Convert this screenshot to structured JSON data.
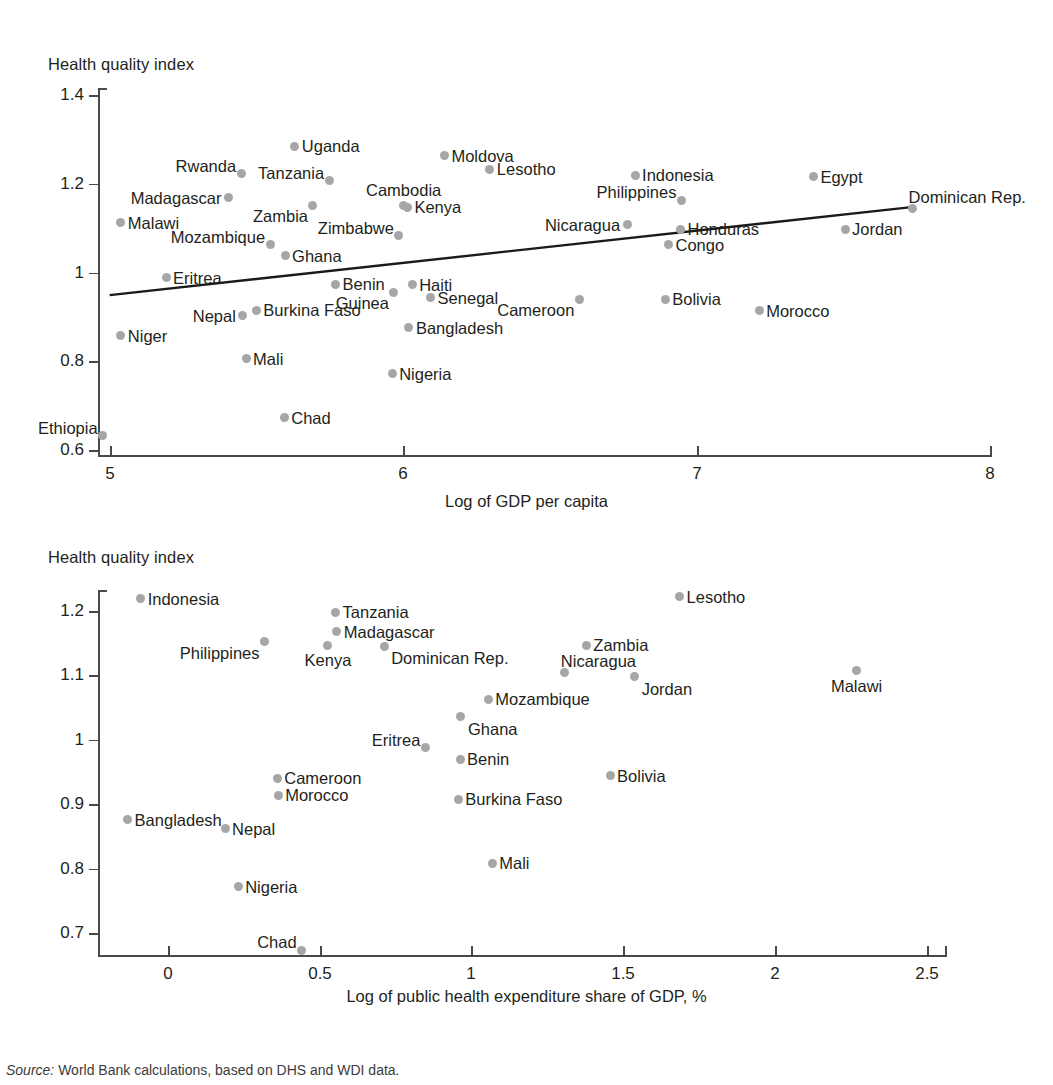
{
  "figure": {
    "source_prefix": "Source:",
    "source_text": " World Bank calculations, based on DHS and WDI data.",
    "marker_color": "#a6a6a6",
    "axis_color": "#4a4a4a",
    "text_color": "#231f20"
  },
  "chart_data": [
    {
      "type": "scatter",
      "title": "",
      "ylabel": "Health quality index",
      "xlabel": "Log of GDP per capita",
      "xlim": [
        4.94,
        8.0
      ],
      "ylim": [
        0.588,
        1.402
      ],
      "xticks": [
        5,
        6,
        7,
        8
      ],
      "xticklabels": [
        "5",
        "6",
        "7",
        "8"
      ],
      "yticks": [
        0.6,
        0.8,
        1.0,
        1.2,
        1.4
      ],
      "yticklabels": [
        "0.6",
        "0.8",
        "1",
        "1.2",
        "1.4"
      ],
      "grid": false,
      "legend": "none",
      "trendline": {
        "x0": 4.999,
        "y0": 0.949,
        "x1": 7.74,
        "y1": 1.148
      },
      "points": [
        {
          "name": "Ethiopia",
          "x": 4.975,
          "y": 0.632,
          "label_pos": "above-left"
        },
        {
          "name": "Niger",
          "x": 5.037,
          "y": 0.857,
          "label_pos": "right"
        },
        {
          "name": "Malawi",
          "x": 5.037,
          "y": 1.112,
          "label_pos": "right"
        },
        {
          "name": "Eritrea",
          "x": 5.191,
          "y": 0.988,
          "label_pos": "right"
        },
        {
          "name": "Madagascar",
          "x": 5.404,
          "y": 1.168,
          "label_pos": "left"
        },
        {
          "name": "Rwanda",
          "x": 5.447,
          "y": 1.222,
          "label_pos": "above-left"
        },
        {
          "name": "Nepal",
          "x": 5.453,
          "y": 0.903,
          "label_pos": "left"
        },
        {
          "name": "Mali",
          "x": 5.464,
          "y": 0.806,
          "label_pos": "right"
        },
        {
          "name": "Burkina Faso",
          "x": 5.499,
          "y": 0.915,
          "label_pos": "right"
        },
        {
          "name": "Mozambique",
          "x": 5.546,
          "y": 1.063,
          "label_pos": "above-left"
        },
        {
          "name": "Chad",
          "x": 5.594,
          "y": 0.673,
          "label_pos": "right"
        },
        {
          "name": "Ghana",
          "x": 5.597,
          "y": 1.038,
          "label_pos": "right"
        },
        {
          "name": "Uganda",
          "x": 5.63,
          "y": 1.285,
          "label_pos": "right"
        },
        {
          "name": "Zambia",
          "x": 5.692,
          "y": 1.152,
          "label_pos": "below-left"
        },
        {
          "name": "Tanzania",
          "x": 5.747,
          "y": 1.207,
          "label_pos": "above-left"
        },
        {
          "name": "Benin",
          "x": 5.769,
          "y": 0.974,
          "label_pos": "right"
        },
        {
          "name": "Nigeria",
          "x": 5.962,
          "y": 0.772,
          "label_pos": "right"
        },
        {
          "name": "Guinea",
          "x": 5.968,
          "y": 0.956,
          "label_pos": "below-left"
        },
        {
          "name": "Zimbabwe",
          "x": 5.985,
          "y": 1.083,
          "label_pos": "above-left"
        },
        {
          "name": "Cambodia",
          "x": 6.001,
          "y": 1.151,
          "label_pos": "above"
        },
        {
          "name": "Kenya",
          "x": 6.014,
          "y": 1.147,
          "label_pos": "right"
        },
        {
          "name": "Haiti",
          "x": 6.03,
          "y": 0.972,
          "label_pos": "right"
        },
        {
          "name": "Bangladesh",
          "x": 6.019,
          "y": 0.876,
          "label_pos": "right"
        },
        {
          "name": "Senegal",
          "x": 6.093,
          "y": 0.943,
          "label_pos": "right"
        },
        {
          "name": "Moldova",
          "x": 6.14,
          "y": 1.263,
          "label_pos": "right"
        },
        {
          "name": "Lesotho",
          "x": 6.295,
          "y": 1.233,
          "label_pos": "right"
        },
        {
          "name": "Cameroon",
          "x": 6.6,
          "y": 0.94,
          "label_pos": "below-left"
        },
        {
          "name": "Nicaragua",
          "x": 6.763,
          "y": 1.108,
          "label_pos": "left"
        },
        {
          "name": "Indonesia",
          "x": 6.79,
          "y": 1.219,
          "label_pos": "right"
        },
        {
          "name": "Bolivia",
          "x": 6.893,
          "y": 0.94,
          "label_pos": "right"
        },
        {
          "name": "Congo",
          "x": 6.904,
          "y": 1.063,
          "label_pos": "right"
        },
        {
          "name": "Philippines",
          "x": 6.948,
          "y": 1.163,
          "label_pos": "above-left"
        },
        {
          "name": "Honduras",
          "x": 6.945,
          "y": 1.097,
          "label_pos": "right"
        },
        {
          "name": "Morocco",
          "x": 7.213,
          "y": 0.914,
          "label_pos": "right"
        },
        {
          "name": "Egypt",
          "x": 7.398,
          "y": 1.216,
          "label_pos": "right"
        },
        {
          "name": "Jordan",
          "x": 7.506,
          "y": 1.097,
          "label_pos": "right"
        },
        {
          "name": "Dominican Rep.",
          "x": 7.736,
          "y": 1.145,
          "label_pos": "above-right"
        }
      ]
    },
    {
      "type": "scatter",
      "title": "",
      "ylabel": "Health quality index",
      "xlabel": "Log of public health expenditure share of GDP, %",
      "xlim": [
        -0.25,
        2.58
      ],
      "ylim": [
        0.655,
        1.245
      ],
      "xticks": [
        0,
        0.5,
        1,
        1.5,
        2,
        2.5
      ],
      "xticklabels": [
        "0",
        "0.5",
        "1",
        "1.5",
        "2",
        "2.5"
      ],
      "yticks": [
        0.7,
        0.8,
        0.9,
        1.0,
        1.1,
        1.2
      ],
      "yticklabels": [
        "0.7",
        "0.8",
        "0.9",
        "1",
        "1.1",
        "1.2"
      ],
      "grid": false,
      "legend": "none",
      "points": [
        {
          "name": "Bangladesh",
          "x": -0.133,
          "y": 0.876,
          "label_pos": "right"
        },
        {
          "name": "Indonesia",
          "x": -0.09,
          "y": 1.219,
          "label_pos": "right"
        },
        {
          "name": "Nepal",
          "x": 0.188,
          "y": 0.862,
          "label_pos": "right"
        },
        {
          "name": "Nigeria",
          "x": 0.231,
          "y": 0.772,
          "label_pos": "right"
        },
        {
          "name": "Philippines",
          "x": 0.318,
          "y": 1.152,
          "label_pos": "below-left"
        },
        {
          "name": "Cameroon",
          "x": 0.36,
          "y": 0.94,
          "label_pos": "right"
        },
        {
          "name": "Morocco",
          "x": 0.363,
          "y": 0.914,
          "label_pos": "right"
        },
        {
          "name": "Chad",
          "x": 0.44,
          "y": 0.673,
          "label_pos": "above-left"
        },
        {
          "name": "Kenya",
          "x": 0.527,
          "y": 1.147,
          "label_pos": "below"
        },
        {
          "name": "Tanzania",
          "x": 0.552,
          "y": 1.198,
          "label_pos": "right"
        },
        {
          "name": "Madagascar",
          "x": 0.556,
          "y": 1.168,
          "label_pos": "right"
        },
        {
          "name": "Dominican Rep.",
          "x": 0.712,
          "y": 1.145,
          "label_pos": "below-right"
        },
        {
          "name": "Eritrea",
          "x": 0.848,
          "y": 0.988,
          "label_pos": "above-left"
        },
        {
          "name": "Burkina Faso",
          "x": 0.956,
          "y": 0.908,
          "label_pos": "right"
        },
        {
          "name": "Benin",
          "x": 0.962,
          "y": 0.97,
          "label_pos": "right"
        },
        {
          "name": "Ghana",
          "x": 0.965,
          "y": 1.036,
          "label_pos": "below-right"
        },
        {
          "name": "Mozambique",
          "x": 1.055,
          "y": 1.063,
          "label_pos": "right"
        },
        {
          "name": "Mali",
          "x": 1.068,
          "y": 0.808,
          "label_pos": "right"
        },
        {
          "name": "Nicaragua",
          "x": 1.307,
          "y": 1.105,
          "label_pos": "above-right"
        },
        {
          "name": "Zambia",
          "x": 1.378,
          "y": 1.147,
          "label_pos": "right"
        },
        {
          "name": "Bolivia",
          "x": 1.456,
          "y": 0.944,
          "label_pos": "right"
        },
        {
          "name": "Jordan",
          "x": 1.537,
          "y": 1.098,
          "label_pos": "below-right"
        },
        {
          "name": "Lesotho",
          "x": 1.685,
          "y": 1.222,
          "label_pos": "right"
        },
        {
          "name": "Malawi",
          "x": 2.268,
          "y": 1.107,
          "label_pos": "below"
        }
      ]
    }
  ]
}
